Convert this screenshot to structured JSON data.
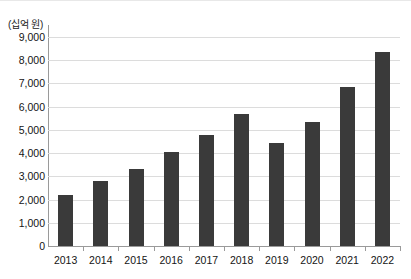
{
  "chart_data": {
    "type": "bar",
    "title": "",
    "xlabel": "",
    "ylabel": "",
    "unit_caption": "(십억 원)",
    "categories": [
      "2013",
      "2014",
      "2015",
      "2016",
      "2017",
      "2018",
      "2019",
      "2020",
      "2021",
      "2022"
    ],
    "values": [
      2200,
      2800,
      3300,
      4050,
      4800,
      5700,
      4450,
      5350,
      6850,
      8350
    ],
    "ylim": [
      0,
      9000
    ],
    "ytick_step": 1000,
    "ytick_labels": [
      "0",
      "1,000",
      "2,000",
      "3,000",
      "4,000",
      "5,000",
      "6,000",
      "7,000",
      "8,000",
      "9,000"
    ],
    "ytick_values": [
      0,
      1000,
      2000,
      3000,
      4000,
      5000,
      6000,
      7000,
      8000,
      9000
    ],
    "grid": true,
    "legend": false,
    "legend_position": "none",
    "bar_color": "#3a3a3a",
    "gridline_color": "#dcdcdc",
    "axis_color": "#9a9a9a",
    "background_color": "#ffffff"
  }
}
